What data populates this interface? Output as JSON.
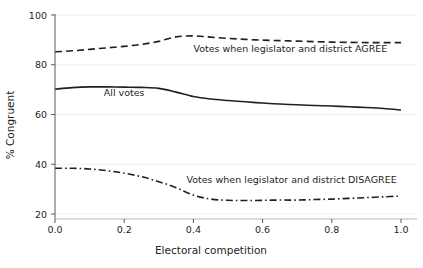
{
  "chart_data": {
    "type": "line",
    "title": "",
    "xlabel": "Electoral competition",
    "ylabel": "% Congruent",
    "xlim": [
      0.0,
      1.0
    ],
    "ylim": [
      18,
      100
    ],
    "grid": true,
    "x_ticks": [
      "0.0",
      "0.2",
      "0.4",
      "0.6",
      "0.8",
      "1.0"
    ],
    "x_tick_values": [
      0.0,
      0.2,
      0.4,
      0.6,
      0.8,
      1.0
    ],
    "y_ticks": [
      "20",
      "40",
      "60",
      "80",
      "100"
    ],
    "y_tick_values": [
      20,
      40,
      60,
      80,
      100
    ],
    "legend_position": "inline-annotations",
    "x": [
      0.0,
      0.05,
      0.1,
      0.15,
      0.2,
      0.25,
      0.3,
      0.35,
      0.4,
      0.45,
      0.5,
      0.55,
      0.6,
      0.65,
      0.7,
      0.75,
      0.8,
      0.85,
      0.9,
      0.95,
      1.0
    ],
    "series": [
      {
        "name": "Votes when legislator and district AGREE",
        "style": "dashed",
        "values": [
          85.2,
          85.6,
          86.2,
          86.8,
          87.4,
          88.2,
          89.4,
          91.2,
          91.6,
          91.1,
          90.6,
          90.2,
          89.9,
          89.7,
          89.5,
          89.3,
          89.1,
          89.0,
          88.9,
          88.9,
          88.9
        ]
      },
      {
        "name": "All votes",
        "style": "solid",
        "values": [
          70.2,
          70.8,
          71.1,
          71.1,
          71.0,
          70.9,
          70.5,
          69.0,
          67.2,
          66.2,
          65.6,
          65.1,
          64.6,
          64.2,
          63.9,
          63.6,
          63.4,
          63.1,
          62.8,
          62.4,
          61.8
        ]
      },
      {
        "name": "Votes when legislator and district DISAGREE",
        "style": "dash-dot",
        "values": [
          38.4,
          38.4,
          38.1,
          37.4,
          36.4,
          35.0,
          33.0,
          30.6,
          27.6,
          26.0,
          25.5,
          25.4,
          25.5,
          25.6,
          25.6,
          25.8,
          26.0,
          26.3,
          26.6,
          26.9,
          27.2
        ]
      }
    ],
    "annotations": [
      {
        "text": "Votes when legislator and district AGREE",
        "x": 0.4,
        "y": 85.0,
        "anchor": "start"
      },
      {
        "text": "All votes",
        "x": 0.2,
        "y": 67.5,
        "anchor": "middle"
      },
      {
        "text": "Votes when legislator and district DISAGREE",
        "x": 0.38,
        "y": 32.5,
        "anchor": "start"
      }
    ]
  },
  "colors": {
    "ink": "#231f20",
    "grid": "#e9e9e9",
    "axis": "#58595b",
    "background": "#ffffff"
  }
}
